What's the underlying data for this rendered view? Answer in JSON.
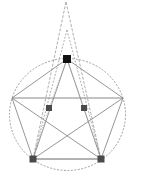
{
  "diagram": {
    "type": "geometric-construction",
    "background": "#ffffff",
    "circle": {
      "cx": 67.5,
      "cy": 114.5,
      "rx": 58,
      "ry": 56,
      "stroke": "#888888",
      "dash": "2,1.5"
    },
    "vertices": {
      "top": [
        67,
        59
      ],
      "left": [
        12,
        98
      ],
      "right": [
        123,
        98
      ],
      "bottom_left": [
        33,
        159
      ],
      "bottom_right": [
        101,
        159
      ]
    },
    "apexes": {
      "outer": [
        66,
        2
      ],
      "inner": [
        67,
        30
      ]
    },
    "mid_points": {
      "mid_left": [
        49,
        108
      ],
      "mid_right": [
        84,
        108
      ]
    },
    "colors": {
      "solid_line": "#8a8a8a",
      "dashed_line": "#9a9a9a",
      "dotted_line": "#a0a0a0",
      "top_marker": "#111111",
      "marker": "#4a4a4a"
    },
    "markers": [
      {
        "name": "top-vertex-marker",
        "x": 67,
        "y": 59,
        "size": 8,
        "color": "#111111"
      },
      {
        "name": "mid-left-marker",
        "x": 49,
        "y": 108,
        "size": 6,
        "color": "#4a4a4a"
      },
      {
        "name": "mid-right-marker",
        "x": 84,
        "y": 108,
        "size": 6,
        "color": "#4a4a4a"
      },
      {
        "name": "bottom-left-marker",
        "x": 33,
        "y": 159,
        "size": 7,
        "color": "#4a4a4a"
      },
      {
        "name": "bottom-right-marker",
        "x": 101,
        "y": 159,
        "size": 7,
        "color": "#4a4a4a"
      }
    ]
  }
}
